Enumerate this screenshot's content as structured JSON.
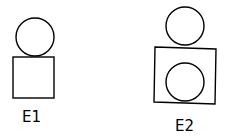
{
  "figures": [
    {
      "label": "E1",
      "shapes": [
        {
          "type": "circle",
          "position": "top"
        },
        {
          "type": "square",
          "position": "bottom"
        }
      ]
    },
    {
      "label": "E2",
      "shapes": [
        {
          "type": "circle",
          "position": "top"
        },
        {
          "type": "square",
          "position": "bottom",
          "contains": "circle"
        }
      ]
    }
  ],
  "colors": {
    "stroke": "#000000",
    "background": "#ffffff"
  }
}
